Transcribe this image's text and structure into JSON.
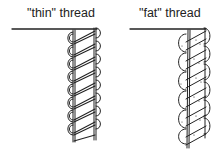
{
  "diagrams": [
    {
      "id": "thin",
      "label": "\"thin\" thread"
    },
    {
      "id": "fat",
      "label": "\"fat\" thread"
    }
  ],
  "colors": {
    "stroke": "#222222",
    "background": "#ffffff"
  }
}
